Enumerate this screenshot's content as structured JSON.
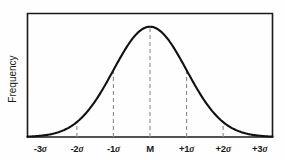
{
  "chart_data": {
    "type": "line",
    "title": "",
    "subtitle": "",
    "xlabel": "",
    "ylabel": "Frequency",
    "grid": false,
    "legend": null,
    "distribution": "normal",
    "mean_label": "M",
    "categories": [
      "-3σ",
      "-2σ",
      "-1σ",
      "M",
      "+1σ",
      "+2σ",
      "+3σ"
    ],
    "x": [
      -3,
      -2,
      -1,
      0,
      1,
      2,
      3
    ],
    "values": [
      0.011,
      0.135,
      0.607,
      1.0,
      0.607,
      0.135,
      0.011
    ],
    "xlim": [
      -3.35,
      3.35
    ],
    "ylim": [
      0,
      1.12
    ],
    "tick_labels": [
      {
        "text": "-3",
        "sigma": "σ",
        "x": -3
      },
      {
        "text": "-2",
        "sigma": "σ",
        "x": -2
      },
      {
        "text": "-1",
        "sigma": "σ",
        "x": -1
      },
      {
        "text": "M",
        "sigma": "",
        "x": 0
      },
      {
        "text": "+1",
        "sigma": "σ",
        "x": 1
      },
      {
        "text": "+2",
        "sigma": "σ",
        "x": 2
      },
      {
        "text": "+3",
        "sigma": "σ",
        "x": 3
      }
    ],
    "annotations": [
      {
        "name": "sigma-marker-minus3",
        "label": "-3σ",
        "x": -3
      },
      {
        "name": "sigma-marker-minus2",
        "label": "-2σ",
        "x": -2
      },
      {
        "name": "sigma-marker-minus1",
        "label": "-1σ",
        "x": -1
      },
      {
        "name": "sigma-marker-mean",
        "label": "M",
        "x": 0
      },
      {
        "name": "sigma-marker-plus1",
        "label": "+1σ",
        "x": 1
      },
      {
        "name": "sigma-marker-plus2",
        "label": "+2σ",
        "x": 2
      },
      {
        "name": "sigma-marker-plus3",
        "label": "+3σ",
        "x": 3
      }
    ],
    "colors": {
      "curve": "#111111",
      "axis": "#1a1a1a",
      "guide": "#8a8a8a",
      "background": "#fefefe",
      "text": "#1a1a1a"
    }
  }
}
